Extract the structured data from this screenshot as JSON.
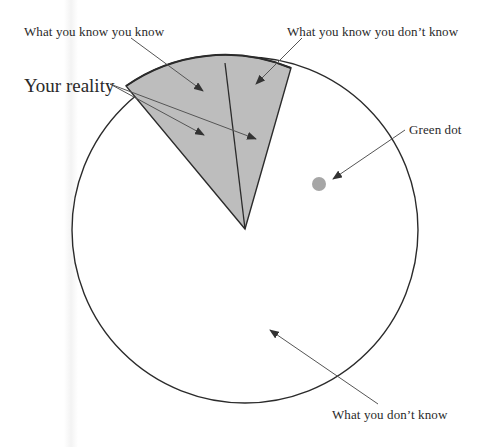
{
  "diagram": {
    "labels": {
      "known_known": "What you know you know",
      "known_unknown": "What you know you don’t know",
      "reality": "Your reality",
      "green_dot": "Green dot",
      "unknown_unknown": "What you don’t know"
    },
    "colors": {
      "wedge_fill": "#bdbdbd",
      "circle_stroke": "#2b2b2b",
      "arrow": "#555555",
      "dot": "#a6a6a6",
      "background": "#ffffff"
    },
    "geometry": {
      "circle_center": [
        245,
        230
      ],
      "circle_radius": 173,
      "wedge_apex": [
        245,
        229
      ],
      "wedge_left_point": [
        126,
        86
      ],
      "wedge_mid_point": [
        225,
        63
      ],
      "wedge_right_point": [
        291,
        68
      ],
      "dot_center": [
        319,
        184
      ],
      "dot_radius": 7
    }
  }
}
